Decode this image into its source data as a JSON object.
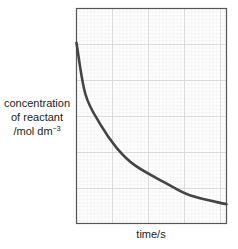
{
  "chart_data": {
    "type": "line",
    "title": "",
    "xlabel": "time/s",
    "ylabel": "concentration of reactant /mol dm⁻³",
    "ylabel_lines": [
      "concentration",
      "of reactant",
      "/mol dm"
    ],
    "ylabel_superscript": "−3",
    "x_ticks": [],
    "y_ticks": [],
    "grid": true,
    "grid_style": "graph paper (major + minor lines)",
    "legend": null,
    "xlim": [
      0,
      1
    ],
    "ylim": [
      0,
      1
    ],
    "series": [
      {
        "name": "concentration of reactant",
        "description": "exponential-style decay curve, starting high on the y-axis and flattening toward the right",
        "x": [
          0.0,
          0.06,
          0.16,
          0.27,
          0.39,
          0.59,
          0.76,
          1.0
        ],
        "y": [
          0.84,
          0.6,
          0.46,
          0.35,
          0.27,
          0.19,
          0.13,
          0.09
        ]
      }
    ]
  },
  "colors": {
    "curve": "#444444",
    "frame": "#555555",
    "grid_major": "#d6d6d6",
    "grid_minor": "#ececec",
    "text": "#222222"
  }
}
